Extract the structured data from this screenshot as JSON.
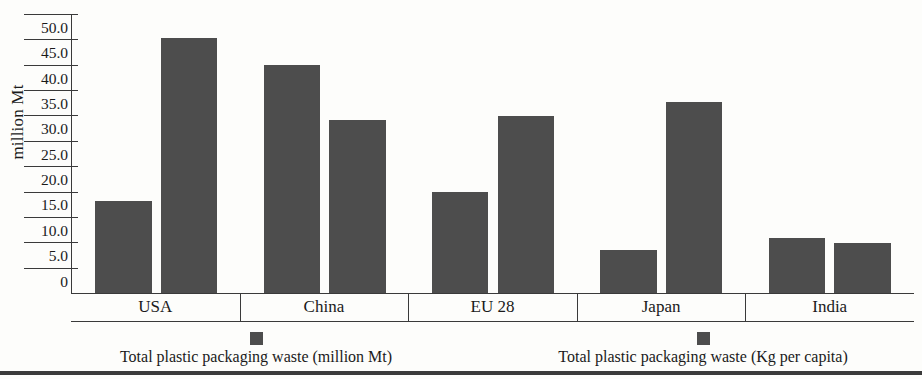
{
  "chart_data": {
    "type": "bar",
    "title": "",
    "xlabel": "",
    "ylabel": "million Mt",
    "ylim": [
      0,
      50
    ],
    "ytick_labels": [
      "50.0",
      "45.0",
      "40.0",
      "35.0",
      "30.0",
      "25.0",
      "20.0",
      "15.0",
      "10.0",
      "5.0",
      "0"
    ],
    "ytick_values": [
      50,
      45,
      40,
      35,
      30,
      25,
      20,
      15,
      10,
      5,
      0
    ],
    "grid": true,
    "legend_position": "bottom",
    "categories": [
      "USA",
      "China",
      "EU 28",
      "Japan",
      "India"
    ],
    "series": [
      {
        "name": "Total plastic packaging waste (million Mt)",
        "color": "#4d4d4d",
        "values": [
          17.3,
          42.8,
          18.9,
          8.0,
          10.4
        ]
      },
      {
        "name": "Total plastic packaging waste (Kg per capita)",
        "color": "#4d4d4d",
        "values": [
          47.8,
          32.4,
          33.3,
          35.9,
          9.4
        ]
      }
    ]
  },
  "legend": {
    "items": [
      {
        "label": "Total plastic packaging waste (million Mt)"
      },
      {
        "label": "Total plastic packaging waste (Kg per capita)"
      }
    ]
  }
}
